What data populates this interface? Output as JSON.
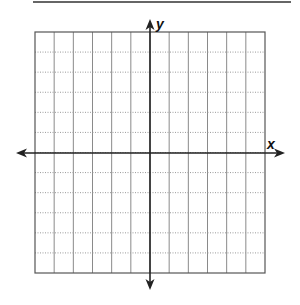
{
  "diagram": {
    "type": "coordinate-plane",
    "top_rule": {
      "x1": 33,
      "x2": 291,
      "y": 2,
      "color": "#333333"
    },
    "grid": {
      "left": 35,
      "top": 32,
      "right": 265,
      "bottom": 273,
      "columns": 12,
      "rows": 12,
      "border_color": "#555555",
      "vertical_line_color": "#8a8a8a",
      "horizontal_line_color": "#9a9a9a",
      "horizontal_line_style": "dotted",
      "vertical_line_style": "solid"
    },
    "x_axis": {
      "label": "x",
      "y": 153,
      "from": 16,
      "to": 285,
      "color": "#222222",
      "arrows": "both"
    },
    "y_axis": {
      "label": "y",
      "x": 150,
      "from": 19,
      "to": 290,
      "color": "#222222",
      "arrows": "both"
    }
  }
}
